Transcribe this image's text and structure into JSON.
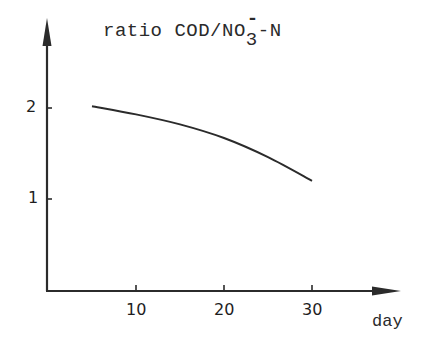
{
  "chart_data": {
    "type": "line",
    "title_parts": {
      "main": "ratio COD/NO",
      "sub": "3",
      "sup": "-",
      "tail": "-N"
    },
    "xlabel": "day",
    "ylabel": "ratio COD/NO3--N",
    "x_ticks": [
      10,
      20,
      30
    ],
    "y_ticks": [
      1,
      2
    ],
    "x_tick_labels": [
      "10",
      "20",
      "30"
    ],
    "y_tick_labels": [
      "1",
      "2"
    ],
    "xlim": [
      0,
      40
    ],
    "ylim": [
      0,
      2.9
    ],
    "grid": false,
    "legend": null,
    "series": [
      {
        "name": "ratio COD/NO3--N",
        "x": [
          5,
          10,
          15,
          20,
          25,
          30
        ],
        "y": [
          2.02,
          1.93,
          1.82,
          1.67,
          1.46,
          1.2
        ]
      }
    ],
    "colors": {
      "line": "#2b2b2b",
      "axis": "#2b2b2b",
      "background": "#ffffff"
    }
  }
}
